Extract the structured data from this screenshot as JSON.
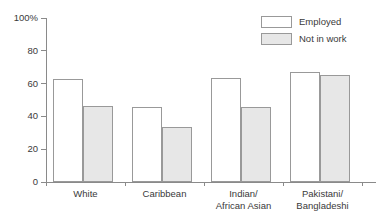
{
  "chart_data": {
    "type": "bar",
    "title": "",
    "subtitle": "",
    "xlabel": "",
    "ylabel": "",
    "ylim": [
      0,
      100
    ],
    "yticks": [
      0,
      20,
      40,
      60,
      80,
      100
    ],
    "ytick_labels": [
      "0",
      "20",
      "40",
      "60",
      "80",
      "100%"
    ],
    "grid": false,
    "legend_position": "top-right",
    "categories": [
      "White",
      "Caribbean",
      "Indian/\nAfrican Asian",
      "Pakistani/\nBangladeshi"
    ],
    "series": [
      {
        "name": "Employed",
        "color": "#ffffff",
        "values": [
          63,
          45.5,
          63.5,
          67
        ]
      },
      {
        "name": "Not in work",
        "color": "#e7e7e7",
        "values": [
          46.5,
          33.5,
          46,
          65
        ]
      }
    ]
  },
  "legend": {
    "items": [
      {
        "label": "Employed",
        "swatch": "white-swatch"
      },
      {
        "label": "Not in work",
        "swatch": "gray-swatch"
      }
    ]
  },
  "colors": {
    "axis": "#8a8a8a",
    "bar_outline": "#999999",
    "employed_fill": "#ffffff",
    "not_in_work_fill": "#e7e7e7",
    "text": "#3a3a3a"
  }
}
